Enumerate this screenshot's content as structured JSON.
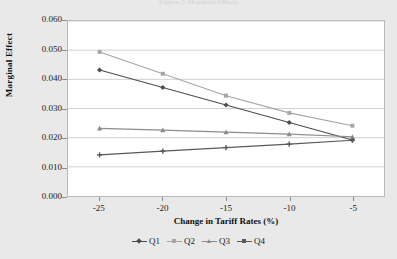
{
  "top_caption": "Figure 2. Marginal Effects",
  "axes": {
    "y_title": "Marginal Effect",
    "x_title": "Change in Tariff Rates (%)"
  },
  "legend": {
    "items": [
      {
        "label": "Q1",
        "color": "#4d4d4d",
        "marker": "diamond"
      },
      {
        "label": "Q2",
        "color": "#a6a6a6",
        "marker": "square"
      },
      {
        "label": "Q3",
        "color": "#8c8c8c",
        "marker": "triangle"
      },
      {
        "label": "Q4",
        "color": "#595959",
        "marker": "cross"
      }
    ]
  },
  "chart_data": {
    "type": "line",
    "title": "Figure 2. Marginal Effects",
    "xlabel": "Change in Tariff Rates (%)",
    "ylabel": "Marginal Effect",
    "x": [
      -25,
      -20,
      -15,
      -10,
      -5
    ],
    "xticklabels": [
      "-25",
      "-20",
      "-15",
      "-10",
      "-5"
    ],
    "yticklabels": [
      "0.000",
      "0.010",
      "0.020",
      "0.030",
      "0.040",
      "0.050",
      "0.060"
    ],
    "yticks": [
      0.0,
      0.01,
      0.02,
      0.03,
      0.04,
      0.05,
      0.06
    ],
    "ylim": [
      0.0,
      0.06
    ],
    "xlim": [
      -27.5,
      -2.5
    ],
    "grid": "horizontal",
    "legend_position": "bottom",
    "series": [
      {
        "name": "Q1",
        "color": "#4d4d4d",
        "values": [
          0.0432,
          0.0372,
          0.0312,
          0.0252,
          0.0192
        ]
      },
      {
        "name": "Q2",
        "color": "#a6a6a6",
        "values": [
          0.0494,
          0.0419,
          0.0344,
          0.0285,
          0.0241
        ]
      },
      {
        "name": "Q3",
        "color": "#8c8c8c",
        "values": [
          0.0232,
          0.0226,
          0.0219,
          0.0212,
          0.0203
        ]
      },
      {
        "name": "Q4",
        "color": "#595959",
        "values": [
          0.0141,
          0.0154,
          0.0166,
          0.0178,
          0.0191
        ]
      }
    ]
  }
}
